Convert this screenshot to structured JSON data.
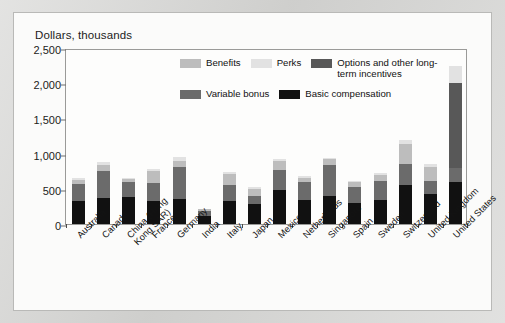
{
  "chart_data": {
    "type": "bar",
    "stacked": true,
    "title": "",
    "ylabel": "Dollars, thousands",
    "xlabel": "",
    "ylim": [
      0,
      2500
    ],
    "yticks": [
      0,
      500,
      1000,
      1500,
      2000,
      2500
    ],
    "ytick_labels": [
      "0",
      "500",
      "1,000",
      "1,500",
      "2,000",
      "2,500"
    ],
    "grid": false,
    "legend_position": "upper-center-inside",
    "categories": [
      "Australia",
      "Canada",
      "China (Hong Kong SAR)",
      "France",
      "Germany",
      "India",
      "Italy",
      "Japan",
      "Mexico",
      "Netherlands",
      "Singapore",
      "Spain",
      "Sweden",
      "Switzerland",
      "United Kingdom",
      "United States"
    ],
    "series": [
      {
        "name": "Basic compensation",
        "color": "#111111",
        "values": [
          320,
          370,
          380,
          330,
          360,
          120,
          330,
          290,
          480,
          340,
          400,
          300,
          340,
          550,
          430,
          600
        ]
      },
      {
        "name": "Variable bonus",
        "color": "#6b6b6b",
        "values": [
          250,
          390,
          210,
          250,
          450,
          70,
          230,
          110,
          290,
          250,
          440,
          220,
          270,
          300,
          180,
          200
        ]
      },
      {
        "name": "Options and other long-term incentives",
        "color": "#585858",
        "values": [
          0,
          0,
          0,
          0,
          0,
          0,
          0,
          0,
          0,
          0,
          0,
          0,
          0,
          0,
          0,
          1200
        ]
      },
      {
        "name": "Benefits",
        "color": "#bdbdbd",
        "values": [
          60,
          80,
          50,
          170,
          90,
          20,
          150,
          100,
          130,
          70,
          80,
          70,
          90,
          280,
          200,
          0
        ]
      },
      {
        "name": "Perks",
        "color": "#e2e2e2",
        "values": [
          30,
          40,
          20,
          30,
          50,
          10,
          30,
          20,
          30,
          20,
          20,
          20,
          20,
          70,
          40,
          250
        ]
      }
    ],
    "totals": [
      660,
      880,
      660,
      780,
      950,
      220,
      740,
      520,
      930,
      680,
      940,
      610,
      720,
      1200,
      850,
      2250
    ],
    "legend": [
      {
        "label": "Benefits",
        "color": "#bdbdbd"
      },
      {
        "label": "Perks",
        "color": "#e2e2e2"
      },
      {
        "label": "Options and other",
        "label2": "long-term incentives",
        "color": "#585858"
      },
      {
        "label": "Variable bonus",
        "color": "#6b6b6b"
      },
      {
        "label": "Basic",
        "label2": "compensation",
        "color": "#111111"
      }
    ]
  }
}
